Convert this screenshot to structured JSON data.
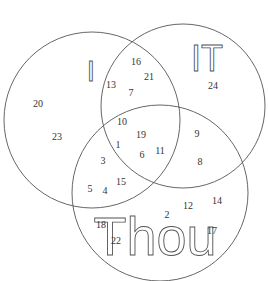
{
  "diagram": {
    "type": "venn",
    "sets": [
      {
        "label": "I",
        "cx": 92,
        "cy": 120,
        "r": 88,
        "label_x": 91,
        "label_y": 81,
        "label_size": 30
      },
      {
        "label": "IT",
        "cx": 183,
        "cy": 106,
        "r": 82,
        "label_x": 207,
        "label_y": 71,
        "label_size": 36
      },
      {
        "label": "Thou",
        "cx": 160,
        "cy": 193,
        "r": 88,
        "label_x": 155,
        "label_y": 255,
        "label_size": 54
      }
    ],
    "numbers": [
      {
        "value": "20",
        "x": 38,
        "y": 107
      },
      {
        "value": "23",
        "x": 57,
        "y": 140
      },
      {
        "value": "16",
        "x": 136,
        "y": 65
      },
      {
        "value": "21",
        "x": 149,
        "y": 80
      },
      {
        "value": "13",
        "x": 111,
        "y": 88
      },
      {
        "value": "7",
        "x": 131,
        "y": 96
      },
      {
        "value": "24",
        "x": 213,
        "y": 89
      },
      {
        "value": "10",
        "x": 122,
        "y": 125
      },
      {
        "value": "19",
        "x": 141,
        "y": 138
      },
      {
        "value": "1",
        "x": 118,
        "y": 148
      },
      {
        "value": "6",
        "x": 142,
        "y": 158
      },
      {
        "value": "11",
        "x": 160,
        "y": 154
      },
      {
        "value": "9",
        "x": 197,
        "y": 137
      },
      {
        "value": "8",
        "x": 200,
        "y": 165
      },
      {
        "value": "3",
        "x": 103,
        "y": 164
      },
      {
        "value": "15",
        "x": 121,
        "y": 185
      },
      {
        "value": "5",
        "x": 90,
        "y": 192
      },
      {
        "value": "4",
        "x": 105,
        "y": 194
      },
      {
        "value": "2",
        "x": 167,
        "y": 218
      },
      {
        "value": "12",
        "x": 188,
        "y": 209
      },
      {
        "value": "14",
        "x": 217,
        "y": 204
      },
      {
        "value": "18",
        "x": 101,
        "y": 228
      },
      {
        "value": "22",
        "x": 116,
        "y": 244
      },
      {
        "value": "17",
        "x": 212,
        "y": 234
      }
    ]
  }
}
